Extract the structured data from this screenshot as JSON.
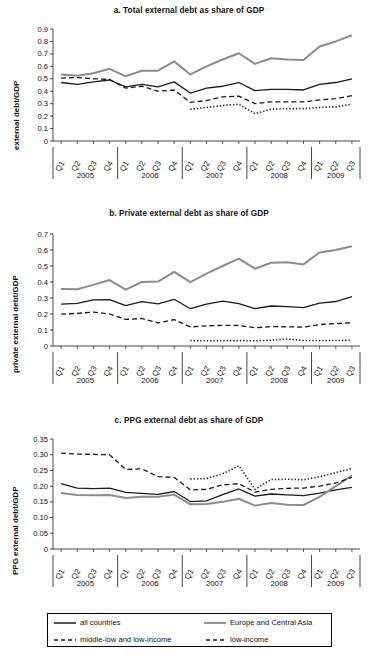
{
  "figure": {
    "series_names": [
      "all countries",
      "Europe and Central Asia",
      "middle-low and low-income",
      "low-income"
    ],
    "colors": {
      "all_countries": "#1a1a1a",
      "europe_central_asia": "#8c8c8c",
      "middle_low_low_income": "#1a1a1a",
      "low_income": "#1a1a1a"
    }
  },
  "legend": {
    "items": [
      {
        "label": "all countries",
        "style": "solid",
        "color": "#1a1a1a",
        "icon": "solid-black-line-swatch"
      },
      {
        "label": "Europe and Central Asia",
        "style": "solid",
        "color": "#8c8c8c",
        "icon": "solid-gray-line-swatch"
      },
      {
        "label": "middle-low and low-income",
        "style": "dashed",
        "color": "#1a1a1a",
        "icon": "dashed-black-line-swatch"
      },
      {
        "label": "low-income",
        "style": "dashed",
        "color": "#1a1a1a",
        "icon": "dashed-black-line-swatch"
      }
    ]
  },
  "x_axis": {
    "quarter_labels": [
      "Q1",
      "Q2",
      "Q3",
      "Q4",
      "Q1",
      "Q2",
      "Q3",
      "Q4",
      "Q1",
      "Q2",
      "Q3",
      "Q4",
      "Q1",
      "Q2",
      "Q3",
      "Q4",
      "Q1",
      "Q2",
      "Q3"
    ],
    "year_groups": [
      {
        "year": "2005",
        "count": 4
      },
      {
        "year": "2006",
        "count": 4
      },
      {
        "year": "2007",
        "count": 4
      },
      {
        "year": "2008",
        "count": 4
      },
      {
        "year": "2009",
        "count": 3
      }
    ]
  },
  "chart_data": [
    {
      "type": "line",
      "panel": "a",
      "title": "a. Total external debt as share of GDP",
      "xlabel": "",
      "ylabel": "external debt/GDP",
      "ylim": [
        0,
        0.9
      ],
      "yticks": [
        "0",
        "0.1",
        "0.2",
        "0.3",
        "0.4",
        "0.5",
        "0.6",
        "0.7",
        "0.8",
        "0.9"
      ],
      "ytick_values": [
        0,
        0.1,
        0.2,
        0.3,
        0.4,
        0.5,
        0.6,
        0.7,
        0.8,
        0.9
      ],
      "grid": false,
      "x": [
        "2005Q1",
        "2005Q2",
        "2005Q3",
        "2005Q4",
        "2006Q1",
        "2006Q2",
        "2006Q3",
        "2006Q4",
        "2007Q1",
        "2007Q2",
        "2007Q3",
        "2007Q4",
        "2008Q1",
        "2008Q2",
        "2008Q3",
        "2008Q4",
        "2009Q1",
        "2009Q2",
        "2009Q3"
      ],
      "series": [
        {
          "name": "all countries",
          "style": "solid",
          "color": "#1a1a1a",
          "values": [
            0.47,
            0.455,
            0.475,
            0.49,
            0.435,
            0.455,
            0.435,
            0.475,
            0.385,
            0.425,
            0.44,
            0.47,
            0.405,
            0.415,
            0.415,
            0.41,
            0.455,
            0.47,
            0.5
          ]
        },
        {
          "name": "Europe and Central Asia",
          "style": "solid",
          "color": "#8c8c8c",
          "values": [
            0.535,
            0.525,
            0.545,
            0.58,
            0.52,
            0.565,
            0.565,
            0.64,
            0.535,
            0.6,
            0.655,
            0.705,
            0.62,
            0.665,
            0.655,
            0.65,
            0.76,
            0.8,
            0.85
          ]
        },
        {
          "name": "middle-low and low-income",
          "style": "dashed",
          "color": "#1a1a1a",
          "values": [
            0.505,
            0.51,
            0.5,
            0.495,
            0.425,
            0.44,
            0.4,
            0.41,
            0.31,
            0.325,
            0.355,
            0.36,
            0.3,
            0.315,
            0.315,
            0.315,
            0.33,
            0.34,
            0.365
          ]
        },
        {
          "name": "low-income",
          "style": "dotted",
          "color": "#1a1a1a",
          "values": [
            null,
            null,
            null,
            null,
            null,
            null,
            null,
            null,
            0.255,
            0.27,
            0.285,
            0.295,
            0.22,
            0.255,
            0.26,
            0.26,
            0.27,
            0.275,
            0.295
          ]
        }
      ]
    },
    {
      "type": "line",
      "panel": "b",
      "title": "b. Private external debt as share of GDP",
      "xlabel": "",
      "ylabel": "private external debt/GDP",
      "ylim": [
        0,
        0.7
      ],
      "yticks": [
        "0",
        "0.1",
        "0.2",
        "0.3",
        "0.4",
        "0.5",
        "0.6",
        "0.7"
      ],
      "ytick_values": [
        0,
        0.1,
        0.2,
        0.3,
        0.4,
        0.5,
        0.6,
        0.7
      ],
      "grid": false,
      "x": [
        "2005Q1",
        "2005Q2",
        "2005Q3",
        "2005Q4",
        "2006Q1",
        "2006Q2",
        "2006Q3",
        "2006Q4",
        "2007Q1",
        "2007Q2",
        "2007Q3",
        "2007Q4",
        "2008Q1",
        "2008Q2",
        "2008Q3",
        "2008Q4",
        "2009Q1",
        "2009Q2",
        "2009Q3"
      ],
      "series": [
        {
          "name": "all countries",
          "style": "solid",
          "color": "#1a1a1a",
          "values": [
            0.262,
            0.266,
            0.288,
            0.29,
            0.252,
            0.278,
            0.263,
            0.292,
            0.233,
            0.262,
            0.28,
            0.265,
            0.234,
            0.25,
            0.246,
            0.24,
            0.268,
            0.278,
            0.308
          ]
        },
        {
          "name": "Europe and Central Asia",
          "style": "solid",
          "color": "#8c8c8c",
          "values": [
            0.356,
            0.355,
            0.382,
            0.412,
            0.352,
            0.4,
            0.403,
            0.463,
            0.399,
            0.452,
            0.5,
            0.546,
            0.483,
            0.52,
            0.523,
            0.51,
            0.585,
            0.6,
            0.623
          ]
        },
        {
          "name": "middle-low and low-income",
          "style": "dashed",
          "color": "#1a1a1a",
          "values": [
            0.199,
            0.204,
            0.212,
            0.2,
            0.166,
            0.172,
            0.144,
            0.165,
            0.119,
            0.126,
            0.129,
            0.128,
            0.114,
            0.121,
            0.12,
            0.118,
            0.134,
            0.14,
            0.146
          ]
        },
        {
          "name": "low-income",
          "style": "dotted",
          "color": "#1a1a1a",
          "values": [
            null,
            null,
            null,
            null,
            null,
            null,
            null,
            null,
            0.034,
            0.033,
            0.033,
            0.034,
            0.032,
            0.036,
            0.044,
            0.034,
            0.034,
            0.034,
            0.036
          ]
        }
      ]
    },
    {
      "type": "line",
      "panel": "c",
      "title": "c. PPG external debt as share of GDP",
      "xlabel": "",
      "ylabel": "PPG external debt/GDP",
      "ylim": [
        0,
        0.35
      ],
      "yticks": [
        "0",
        "0.05",
        "0.10",
        "0.15",
        "0.20",
        "0.25",
        "0.30",
        "0.35"
      ],
      "ytick_values": [
        0,
        0.05,
        0.1,
        0.15,
        0.2,
        0.25,
        0.3,
        0.35
      ],
      "grid": false,
      "x": [
        "2005Q1",
        "2005Q2",
        "2005Q3",
        "2005Q4",
        "2006Q1",
        "2006Q2",
        "2006Q3",
        "2006Q4",
        "2007Q1",
        "2007Q2",
        "2007Q3",
        "2007Q4",
        "2008Q1",
        "2008Q2",
        "2008Q3",
        "2008Q4",
        "2009Q1",
        "2009Q2",
        "2009Q3"
      ],
      "series": [
        {
          "name": "all countries",
          "style": "solid",
          "color": "#1a1a1a",
          "values": [
            0.208,
            0.194,
            0.192,
            0.194,
            0.18,
            0.177,
            0.174,
            0.183,
            0.151,
            0.153,
            0.173,
            0.191,
            0.168,
            0.175,
            0.172,
            0.17,
            0.178,
            0.188,
            0.196
          ]
        },
        {
          "name": "Europe and Central Asia",
          "style": "solid",
          "color": "#8c8c8c",
          "values": [
            0.178,
            0.172,
            0.171,
            0.172,
            0.162,
            0.166,
            0.166,
            0.173,
            0.142,
            0.143,
            0.15,
            0.16,
            0.138,
            0.146,
            0.141,
            0.14,
            0.166,
            0.2,
            0.234
          ]
        },
        {
          "name": "middle-low and low-income",
          "style": "dashed",
          "color": "#1a1a1a",
          "values": [
            0.305,
            0.302,
            0.301,
            0.3,
            0.253,
            0.255,
            0.23,
            0.228,
            0.188,
            0.19,
            0.204,
            0.208,
            0.181,
            0.19,
            0.193,
            0.194,
            0.2,
            0.21,
            0.228
          ]
        },
        {
          "name": "low-income",
          "style": "dotted",
          "color": "#1a1a1a",
          "values": [
            null,
            null,
            null,
            null,
            null,
            null,
            null,
            null,
            0.223,
            0.224,
            0.239,
            0.265,
            0.19,
            0.221,
            0.222,
            0.22,
            0.23,
            0.243,
            0.256
          ]
        }
      ]
    }
  ]
}
